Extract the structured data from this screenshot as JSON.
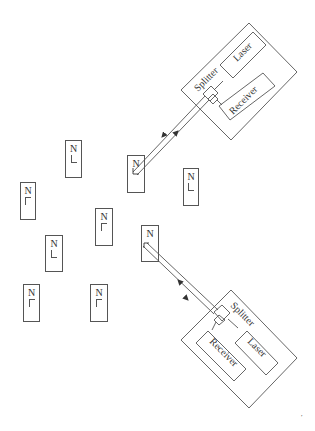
{
  "diagram": {
    "line_color": "#555555",
    "text_color": "#333333",
    "node_label": "N",
    "nodes": [
      {
        "id": "node-a",
        "label": "N",
        "x": 65,
        "y": 140,
        "w": 17,
        "h": 38,
        "glyph": "down"
      },
      {
        "id": "node-b",
        "label": "N",
        "x": 20,
        "y": 182,
        "w": 16,
        "h": 38,
        "glyph": "up"
      },
      {
        "id": "node-c",
        "label": "N",
        "x": 95,
        "y": 208,
        "w": 18,
        "h": 38,
        "glyph": "up"
      },
      {
        "id": "node-d",
        "label": "N",
        "x": 45,
        "y": 235,
        "w": 18,
        "h": 37,
        "glyph": "down"
      },
      {
        "id": "node-e",
        "label": "N",
        "x": 90,
        "y": 284,
        "w": 18,
        "h": 38,
        "glyph": "up"
      },
      {
        "id": "node-f",
        "label": "N",
        "x": 23,
        "y": 284,
        "w": 17,
        "h": 38,
        "glyph": "up"
      },
      {
        "id": "node-g",
        "label": "N",
        "x": 127,
        "y": 155,
        "w": 18,
        "h": 38,
        "glyph": "down",
        "linked": true
      },
      {
        "id": "node-h",
        "label": "N",
        "x": 183,
        "y": 168,
        "w": 16,
        "h": 38,
        "glyph": "down"
      },
      {
        "id": "node-i",
        "label": "N",
        "x": 141,
        "y": 225,
        "w": 18,
        "h": 37,
        "glyph": "up",
        "linked": true
      }
    ],
    "terminals": [
      {
        "id": "terminal-top",
        "splitter_label": "Splitter",
        "laser_label": "Laser",
        "receiver_label": "Receiver"
      },
      {
        "id": "terminal-bottom",
        "splitter_label": "Splitter",
        "laser_label": "Laser",
        "receiver_label": "Receiver"
      }
    ],
    "links": [
      {
        "from": "terminal-top",
        "to": "node-g",
        "type": "bidirectional"
      },
      {
        "from": "terminal-bottom",
        "to": "node-i",
        "type": "bidirectional"
      }
    ],
    "corner_mark": "′"
  }
}
